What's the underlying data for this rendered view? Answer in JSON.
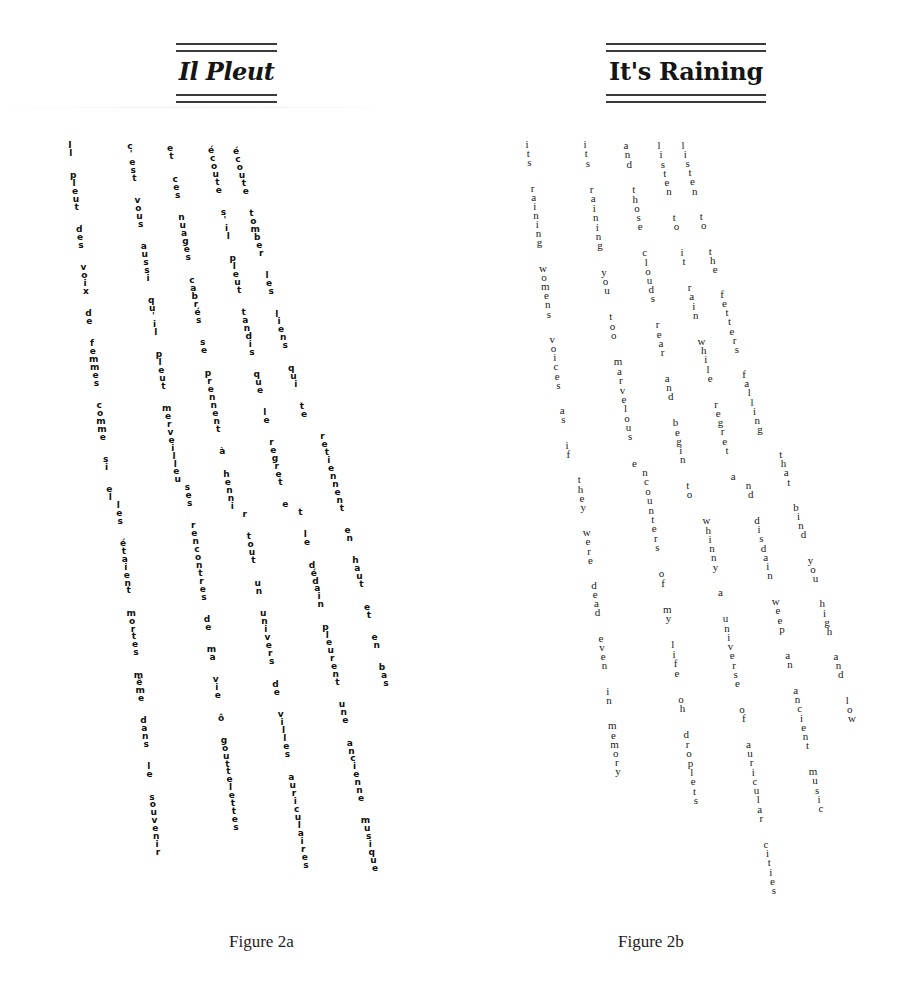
{
  "figure_a": {
    "title": "Il Pleut",
    "caption": "Figure 2a",
    "lines": [
      {
        "text": "Il pleut des voix de femmes comme si elles étaient mortes même dans le souvenir",
        "start": [
          70,
          145
        ],
        "end": [
          158,
          852
        ]
      },
      {
        "text": "c'est vous aussi qu'il pleut merveilleuses rencontres de ma vie ô gouttelettes",
        "start": [
          130,
          146
        ],
        "end": [
          236,
          827
        ]
      },
      {
        "text": "et ces nuages cabrés se prennent à hennir tout un univers de villes auriculaires",
        "start": [
          170,
          148
        ],
        "end": [
          306,
          865
        ]
      },
      {
        "text": "écoute s'il pleut tandis que le regret et le dédain pleurent une ancienne musique",
        "start": [
          211,
          150
        ],
        "end": [
          375,
          868
        ]
      },
      {
        "text": "écoute tomber les liens qui te retiennent en haut et en bas",
        "start": [
          236,
          151
        ],
        "end": [
          386,
          683
        ]
      }
    ]
  },
  "figure_b": {
    "title": "It's Raining",
    "caption": "Figure 2b",
    "lines": [
      {
        "text": "its raining womens voices as if they were dead even in memory",
        "start": [
          527,
          144
        ],
        "end": [
          618,
          771
        ]
      },
      {
        "text": "its raining you too marvelous encounters of my life oh droplets",
        "start": [
          585,
          144
        ],
        "end": [
          696,
          800
        ]
      },
      {
        "text": "and those clouds rear and begin to whinny a universe of auricular cities",
        "start": [
          626,
          145
        ],
        "end": [
          774,
          890
        ]
      },
      {
        "text": "listen to it rain while regret and disdain weep an ancient music",
        "start": [
          659,
          145
        ],
        "end": [
          821,
          808
        ]
      },
      {
        "text": "listen to the fetters falling that bind you high and low",
        "start": [
          683,
          145
        ],
        "end": [
          852,
          718
        ]
      }
    ]
  }
}
